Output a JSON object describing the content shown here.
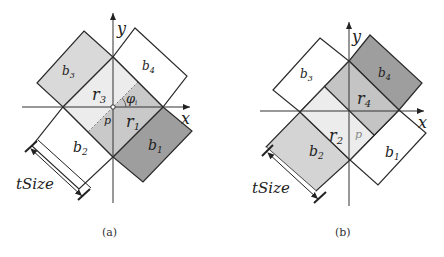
{
  "panels": [
    {
      "id": "a",
      "caption": "(a)",
      "axis_x_label": "x",
      "axis_y_label": "y",
      "blocks": {
        "b1": "b",
        "b1_sub": "1",
        "b2": "b",
        "b2_sub": "2",
        "b3": "b",
        "b3_sub": "3",
        "b4": "b",
        "b4_sub": "4"
      },
      "regions": {
        "r1": "r",
        "r1_sub": "1",
        "r3": "r",
        "r3_sub": "3"
      },
      "point_label": "p",
      "angle_label": "φ",
      "angle_sub": "i",
      "dimension_label": "tSize"
    },
    {
      "id": "b",
      "caption": "(b)",
      "axis_x_label": "x",
      "axis_y_label": "y",
      "blocks": {
        "b1": "b",
        "b1_sub": "1",
        "b2": "b",
        "b2_sub": "2",
        "b3": "b",
        "b3_sub": "3",
        "b4": "b",
        "b4_sub": "4"
      },
      "regions": {
        "r2": "r",
        "r2_sub": "2",
        "r4": "r",
        "r4_sub": "4"
      },
      "point_label": "p",
      "dimension_label": "tSize"
    }
  ],
  "colors": {
    "light_fill": "#e6e6e6",
    "mid_fill": "#c8c8c8",
    "dark_fill": "#9a9a9a",
    "lightest_fill": "#f0f0f0",
    "stroke": "#2a2a2a"
  }
}
